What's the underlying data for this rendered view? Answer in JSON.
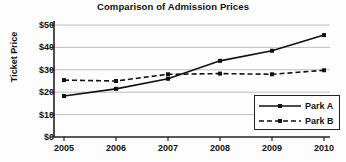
{
  "chart_data": {
    "type": "line",
    "title": "Comparison of Admission Prices",
    "xlabel": "",
    "ylabel": "Ticket Price",
    "categories": [
      "2005",
      "2006",
      "2007",
      "2008",
      "2009",
      "2010"
    ],
    "x": [
      2005,
      2006,
      2007,
      2008,
      2009,
      2010
    ],
    "series": [
      {
        "name": "Park A",
        "values": [
          18.3,
          21.5,
          26.0,
          34.0,
          38.5,
          45.5
        ],
        "linestyle": "solid",
        "color": "#111111",
        "marker": "square"
      },
      {
        "name": "Park B",
        "values": [
          25.4,
          25.0,
          28.0,
          28.3,
          28.0,
          29.8
        ],
        "linestyle": "dashed",
        "color": "#111111",
        "marker": "square"
      }
    ],
    "ylim": [
      0,
      50
    ],
    "yticks": [
      0,
      10,
      20,
      30,
      40,
      50
    ],
    "ytick_labels": [
      "$0",
      "$10",
      "$20",
      "$30",
      "$40",
      "$50"
    ],
    "grid": "horizontal",
    "legend_position": "lower right"
  },
  "legend": {
    "entries": [
      {
        "label": "Park A"
      },
      {
        "label": "Park B"
      }
    ]
  }
}
